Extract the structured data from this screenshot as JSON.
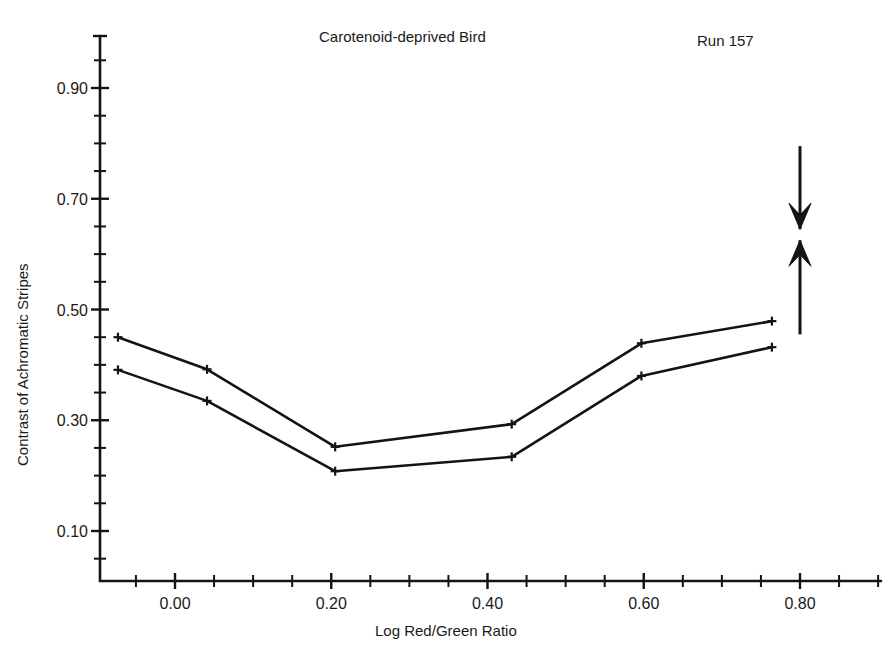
{
  "chart_data": {
    "type": "line",
    "title": "Carotenoid-deprived Bird",
    "annotation_run": "Run 157",
    "xlabel": "Log Red/Green Ratio",
    "ylabel": "Contrast of Achromatic Stripes",
    "xlim": [
      -0.095,
      0.91
    ],
    "ylim": [
      0.0,
      1.0
    ],
    "grid": false,
    "legend": "none",
    "x_ticks_major": [
      0.0,
      0.2,
      0.4,
      0.6,
      0.8
    ],
    "x_tick_labels": [
      "0.00",
      "0.20",
      "0.40",
      "0.60",
      "0.80"
    ],
    "x_tick_minor_step": 0.05,
    "y_ticks_major": [
      0.1,
      0.3,
      0.5,
      0.7,
      0.9
    ],
    "y_tick_labels": [
      "0.10",
      "0.30",
      "0.50",
      "0.70",
      "0.90"
    ],
    "y_tick_minor_step": 0.05,
    "x": [
      -0.073,
      0.041,
      0.205,
      0.431,
      0.597,
      0.764
    ],
    "series": [
      {
        "name": "upper curve",
        "values": [
          0.45,
          0.392,
          0.252,
          0.293,
          0.439,
          0.479
        ]
      },
      {
        "name": "lower curve",
        "values": [
          0.391,
          0.335,
          0.208,
          0.234,
          0.38,
          0.432
        ]
      }
    ],
    "annotations": [
      {
        "name": "down-arrow",
        "x": 0.8,
        "y_from": 0.795,
        "y_to": 0.645
      },
      {
        "name": "up-arrow",
        "x": 0.8,
        "y_from": 0.455,
        "y_to": 0.625
      }
    ]
  },
  "figure": {
    "title": "Carotenoid-deprived Bird",
    "run_label": "Run 157",
    "x_axis_title": "Log Red/Green Ratio",
    "y_axis_title": "Contrast of Achromatic Stripes",
    "x_tick_labels": [
      "0.00",
      "0.20",
      "0.40",
      "0.60",
      "0.80"
    ],
    "y_tick_labels": [
      "0.10",
      "0.30",
      "0.50",
      "0.70",
      "0.90"
    ]
  }
}
